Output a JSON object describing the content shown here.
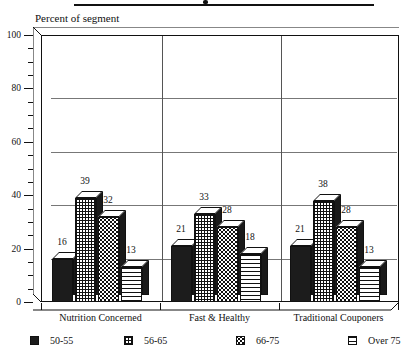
{
  "chart_data": {
    "type": "bar",
    "title": "",
    "ylabel": "Percent of segment",
    "xlabel": "",
    "categories": [
      "Nutrition Concerned",
      "Fast & Healthy",
      "Traditional Couponers"
    ],
    "series": [
      {
        "name": "50-55",
        "pattern": "solid",
        "values": [
          16,
          21,
          21
        ]
      },
      {
        "name": "56-65",
        "pattern": "grid",
        "values": [
          39,
          33,
          38
        ]
      },
      {
        "name": "66-75",
        "pattern": "dots",
        "values": [
          32,
          28,
          28
        ]
      },
      {
        "name": "Over 75",
        "pattern": "hlines",
        "values": [
          13,
          18,
          13
        ]
      }
    ],
    "ylim": [
      0,
      100
    ],
    "yticks": [
      0,
      20,
      40,
      60,
      80,
      100
    ],
    "ytick_labels": [
      "0",
      "20",
      "40",
      "60",
      "80",
      "100"
    ],
    "minor_tick_step": 5,
    "grid": true,
    "legend_position": "bottom",
    "style": "3d-column"
  },
  "axes": {
    "y_axis_label": "Percent of segment",
    "y_tick_labels": [
      "100",
      "80",
      "60",
      "40",
      "20",
      "0"
    ],
    "x_category_labels": [
      "Nutrition Concerned",
      "Fast & Healthy",
      "Traditional Couponers"
    ]
  },
  "value_labels": {
    "group1": [
      "16",
      "39",
      "32",
      "13"
    ],
    "group2": [
      "21",
      "33",
      "28",
      "18"
    ],
    "group3": [
      "21",
      "38",
      "28",
      "13"
    ]
  },
  "legend": {
    "items": [
      {
        "label": "50-55"
      },
      {
        "label": "56-65"
      },
      {
        "label": "66-75"
      },
      {
        "label": "Over 75"
      }
    ]
  },
  "colors": {
    "ink": "#111111",
    "grid": "#777777",
    "background": "#ffffff"
  }
}
